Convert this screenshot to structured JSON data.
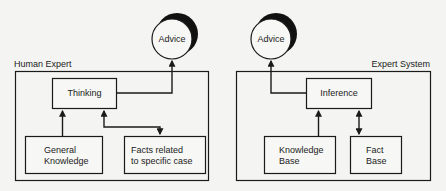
{
  "human_expert": {
    "title": "Human Expert",
    "advice": "Advice",
    "thinking": "Thinking",
    "general_knowledge": [
      "General",
      "Knowledge"
    ],
    "facts": [
      "Facts related",
      "to specific case"
    ]
  },
  "expert_system": {
    "title": "Expert System",
    "advice": "Advice",
    "inference": "Inference",
    "knowledge_base": [
      "Knowledge",
      "Base"
    ],
    "fact_base": [
      "Fact",
      "Base"
    ]
  },
  "colors": {
    "line": "#1a1a1a",
    "background": "#f4f4f2"
  }
}
